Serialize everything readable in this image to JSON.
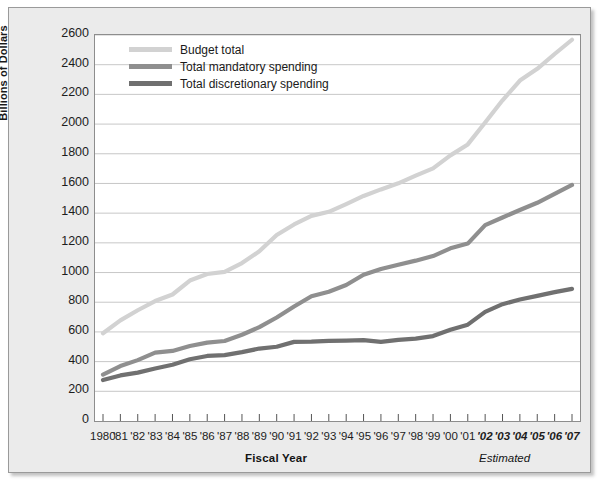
{
  "chart_data": {
    "type": "line",
    "title": "",
    "xlabel": "Fiscal Year",
    "ylabel": "Billions of Dollars",
    "ylim": [
      0,
      2600
    ],
    "ytick_step": 200,
    "grid": true,
    "legend_position": "top-left",
    "annotations": [
      {
        "text": "Estimated",
        "note": "covers fiscal years '02 through '07"
      }
    ],
    "ytick_labels": [
      "2600",
      "2400",
      "2200",
      "2000",
      "1800",
      "1600",
      "1400",
      "1200",
      "1000",
      "800",
      "600",
      "400",
      "200",
      "0"
    ],
    "categories": [
      "1980",
      "'81",
      "'82",
      "'83",
      "'84",
      "'85",
      "'86",
      "'87",
      "'88",
      "'89",
      "'90",
      "'91",
      "'92",
      "'93",
      "'94",
      "'95",
      "'96",
      "'97",
      "'98",
      "'99",
      "'00",
      "'01",
      "'02",
      "'03",
      "'04",
      "'05",
      "'06",
      "'07"
    ],
    "estimated_categories": [
      "'02",
      "'03",
      "'04",
      "'05",
      "'06",
      "'07"
    ],
    "series": [
      {
        "name": "Budget total",
        "color": "#d2d2d2",
        "values": [
          591,
          678,
          746,
          808,
          852,
          946,
          990,
          1004,
          1064,
          1143,
          1253,
          1324,
          1382,
          1409,
          1461,
          1516,
          1560,
          1601,
          1653,
          1702,
          1789,
          1863,
          2011,
          2160,
          2293,
          2372,
          2472,
          2568
        ]
      },
      {
        "name": "Total mandatory spending",
        "color": "#8f8f8f",
        "values": [
          313,
          370,
          410,
          461,
          472,
          505,
          528,
          539,
          581,
          632,
          697,
          771,
          840,
          871,
          916,
          985,
          1024,
          1053,
          1080,
          1111,
          1163,
          1195,
          1319,
          1371,
          1421,
          1470,
          1530,
          1590
        ]
      },
      {
        "name": "Total discretionary spending",
        "color": "#707070",
        "values": [
          276,
          307,
          326,
          354,
          379,
          416,
          438,
          444,
          464,
          488,
          500,
          533,
          534,
          540,
          542,
          545,
          533,
          547,
          555,
          572,
          615,
          649,
          735,
          787,
          818,
          843,
          868,
          890
        ]
      }
    ]
  },
  "legend": {
    "items": [
      {
        "label": "Budget total",
        "color": "#d2d2d2"
      },
      {
        "label": "Total mandatory spending",
        "color": "#8f8f8f"
      },
      {
        "label": "Total discretionary spending",
        "color": "#707070"
      }
    ]
  },
  "axis": {
    "y_title": "Billions of Dollars",
    "x_title": "Fiscal Year",
    "estimated_note": "Estimated"
  }
}
